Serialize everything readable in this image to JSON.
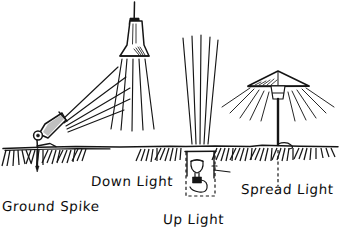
{
  "diagram": {
    "style": "hand-drawn line sketch",
    "ink_color": "#151515",
    "background_color": "#ffffff",
    "ground_line_y": 147,
    "labels": [
      {
        "id": "ground-spike",
        "text": "Ground Spike"
      },
      {
        "id": "down-light",
        "text": "Down Light"
      },
      {
        "id": "up-light",
        "text": "Up Light"
      },
      {
        "id": "spread-light",
        "text": "Spread Light"
      }
    ],
    "fixtures": [
      {
        "id": "ground-spike",
        "label": "Ground Spike",
        "description": "Angled conical spotlight on a knuckle joint mounted to a pointed spike driven into the soil; beam aimed up and to the right.",
        "beam_direction": "up-right",
        "beam_count": 5,
        "mounting": "spike in ground"
      },
      {
        "id": "down-light",
        "label": "Down Light",
        "description": "Bell shaped pendant fixture suspended from a thin stem above; beam spreads downward to the ground.",
        "beam_direction": "down",
        "beam_count": 5,
        "mounting": "overhead suspended"
      },
      {
        "id": "up-light",
        "label": "Up Light",
        "description": "Well light recessed in a dashed in-ground box below grade; narrow beam fans straight upward.",
        "beam_direction": "up",
        "beam_count": 5,
        "mounting": "recessed in-ground well"
      },
      {
        "id": "spread-light",
        "label": "Spread Light",
        "description": "Mushroom or pagoda cap on a slim post; light radiates outward and downward in a wide fan.",
        "beam_direction": "outward-down",
        "beam_count": 10,
        "mounting": "post with buried stem"
      }
    ],
    "ground": {
      "hatch_description": "fan clusters of short diagonal tick marks below the grade line",
      "hatch_clusters": 12
    }
  }
}
